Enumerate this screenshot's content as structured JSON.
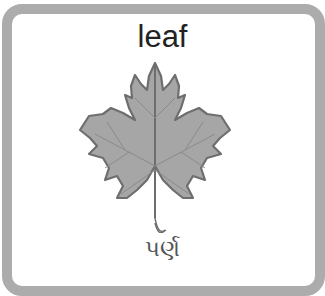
{
  "card": {
    "title": "leaf",
    "subtitle": "પર્ણ",
    "image": "maple-leaf-icon"
  },
  "colors": {
    "frame": "#acacac",
    "leaf_fill": "#a6a6a6",
    "leaf_outline": "#6e6e6e",
    "title_text": "#222222",
    "subtitle_text": "#555555"
  }
}
